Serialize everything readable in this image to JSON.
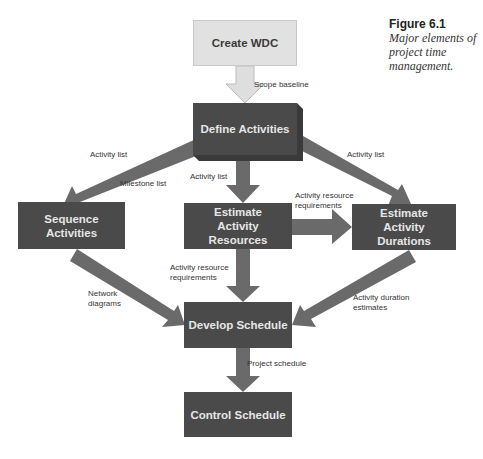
{
  "caption": {
    "title": "Figure 6.1",
    "description": "Major elements of project time management."
  },
  "nodes": {
    "create_wbs": "Create WDC",
    "define_activities": "Define Activities",
    "sequence_activities": "Sequence Activities",
    "estimate_resources": "Estimate Activity Resources",
    "estimate_durations": "Estimate Activity Durations",
    "develop_schedule": "Develop Schedule",
    "control_schedule": "Control Schedule"
  },
  "edge_labels": {
    "scope_baseline": "Scope baseline",
    "activity_list_left": "Activity list",
    "milestone_list": "Milestone list",
    "activity_list_center": "Activity list",
    "activity_list_right": "Activity list",
    "resource_req_right_1": "Activity resource",
    "resource_req_right_2": "requirements",
    "resource_req_down_1": "Activity resource",
    "resource_req_down_2": "requirements",
    "network_diagrams_1": "Network",
    "network_diagrams_2": "diagrams",
    "duration_estimates_1": "Activity duration",
    "duration_estimates_2": "estimates",
    "project_schedule": "Project schedule"
  },
  "colors": {
    "box_dark": "#4a4a4a",
    "box_light": "#e1e1e1",
    "arrow_dark": "#6a6a6a",
    "arrow_light": "#dcdcdc"
  }
}
